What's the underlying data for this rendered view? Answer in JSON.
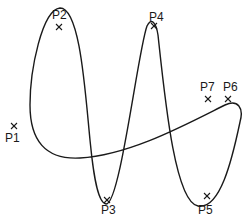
{
  "diagram": {
    "type": "spline-curve-with-control-points",
    "colors": {
      "curve": "#1a1a1a",
      "background": "#ffffff"
    },
    "points": [
      {
        "id": "P1",
        "label": "P1",
        "x": 14,
        "y": 126,
        "label_x": 5,
        "label_y": 142
      },
      {
        "id": "P2",
        "label": "P2",
        "x": 59,
        "y": 27,
        "label_x": 52,
        "label_y": 19
      },
      {
        "id": "P3",
        "label": "P3",
        "x": 107,
        "y": 200,
        "label_x": 101,
        "label_y": 214
      },
      {
        "id": "P4",
        "label": "P4",
        "x": 154,
        "y": 26,
        "label_x": 149,
        "label_y": 21
      },
      {
        "id": "P5",
        "label": "P5",
        "x": 207,
        "y": 196,
        "label_x": 198,
        "label_y": 214
      },
      {
        "id": "P6",
        "label": "P6",
        "x": 228,
        "y": 99,
        "label_x": 223,
        "label_y": 91
      },
      {
        "id": "P7",
        "label": "P7",
        "x": 208,
        "y": 99,
        "label_x": 200,
        "label_y": 91
      }
    ]
  }
}
